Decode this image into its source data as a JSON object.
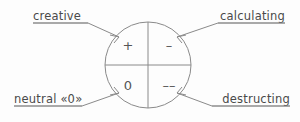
{
  "diagram": {
    "background_color": "#fdfdfd",
    "line_color": "#8a8a8a",
    "text_color": "#4a4a4a",
    "circle": {
      "center_x": 148,
      "center_y": 65,
      "radius": 43
    },
    "quadrants": [
      {
        "id": "top-left",
        "symbol": "+",
        "label_ref": "creative"
      },
      {
        "id": "top-right",
        "symbol": "–",
        "label_ref": "calculating"
      },
      {
        "id": "bottom-left",
        "symbol": "0",
        "label_ref": "neutral"
      },
      {
        "id": "bottom-right",
        "symbol": "––",
        "label_ref": "destructing"
      }
    ],
    "labels": {
      "creative": "creative",
      "calculating": "calculating",
      "neutral": "neutral «0»",
      "destructing": "destructing"
    }
  }
}
